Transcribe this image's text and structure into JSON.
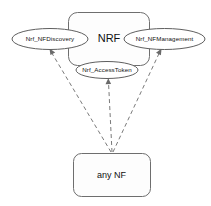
{
  "diagram": {
    "background_color": "#ffffff",
    "stroke_color": "#6e6e6e",
    "text_color": "#111111",
    "nrf_container": {
      "label": "NRF",
      "shape": "rounded-rectangle"
    },
    "consumer": {
      "label": "any NF",
      "shape": "rounded-rectangle"
    },
    "services": [
      {
        "id": "nf-discovery",
        "label": "Nrf_NFDiscovery",
        "shape": "ellipse",
        "position": "left"
      },
      {
        "id": "nf-management",
        "label": "Nrf_NFManagement",
        "shape": "ellipse",
        "position": "right"
      },
      {
        "id": "access-token",
        "label": "Nrf_AccessToken",
        "shape": "ellipse",
        "position": "bottom-center"
      }
    ],
    "connections": [
      {
        "id": "conn-discovery",
        "from": "any NF",
        "to": "Nrf_NFDiscovery",
        "style": "dashed",
        "arrow": "end"
      },
      {
        "id": "conn-access-token",
        "from": "any NF",
        "to": "Nrf_AccessToken",
        "style": "dashed",
        "arrow": "end"
      },
      {
        "id": "conn-management",
        "from": "any NF",
        "to": "Nrf_NFManagement",
        "style": "dashed",
        "arrow": "end"
      }
    ]
  }
}
